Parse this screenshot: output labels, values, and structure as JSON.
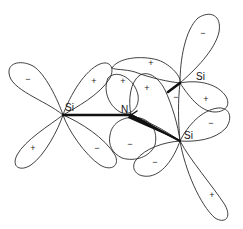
{
  "diagram": {
    "atoms": [
      {
        "id": "si_left",
        "label": "Si",
        "x": 63,
        "y": 115
      },
      {
        "id": "n_center",
        "label": "N",
        "x": 131,
        "y": 115
      },
      {
        "id": "si_top_right",
        "label": "Si",
        "x": 180,
        "y": 83
      },
      {
        "id": "si_bottom_right",
        "label": "Si",
        "x": 180,
        "y": 141
      }
    ],
    "labels": {
      "si_left": "Si",
      "n_center": "N",
      "si_top_right": "Si",
      "si_bottom_right": "Si"
    },
    "signs": {
      "si_left_upper_left": "−",
      "si_left_upper_right": "+",
      "si_left_lower_left": "+",
      "si_left_lower_right": "−",
      "center_upper_1": "+",
      "center_upper_2": "+",
      "center_upper_3": "+",
      "center_lower_1": "−",
      "center_lower_2": "−",
      "si_top_right_upper": "−",
      "si_top_right_bond": "−",
      "si_top_right_right": "+",
      "si_bottom_right_upper": "−",
      "si_bottom_right_lower": "+",
      "center_lower_3": "−"
    },
    "colors": {
      "line": "#2a2a2a",
      "bond": "#111111",
      "background": "#ffffff"
    }
  }
}
